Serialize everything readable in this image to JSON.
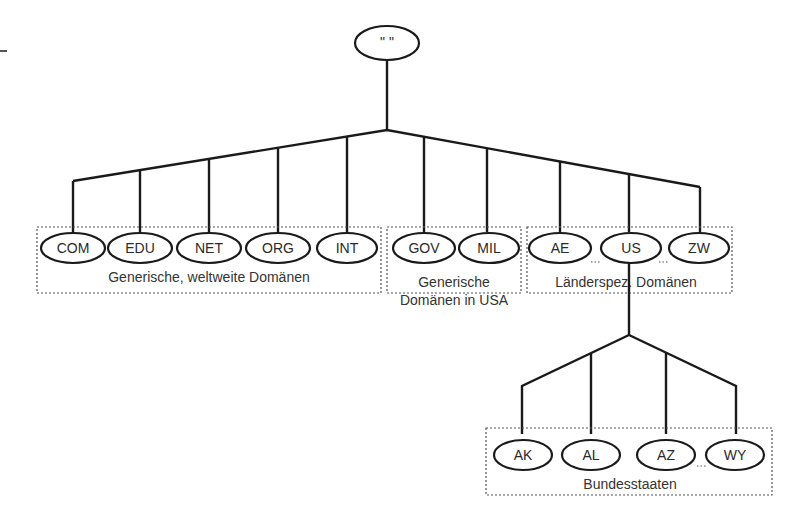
{
  "diagram": {
    "root": {
      "label": "\" \""
    },
    "groups": [
      {
        "label": "Generische, weltweite Domänen",
        "nodes": [
          "COM",
          "EDU",
          "NET",
          "ORG",
          "INT"
        ]
      },
      {
        "label_line1": "Generische",
        "label_line2": "Domänen in USA",
        "nodes": [
          "GOV",
          "MIL"
        ]
      },
      {
        "label": "Länderspez. Domänen",
        "nodes": [
          "AE",
          "US",
          "ZW"
        ],
        "ellipsis_between": [
          [
            "AE",
            "US"
          ],
          [
            "US",
            "ZW"
          ]
        ]
      },
      {
        "label": "Bundesstaaten",
        "parent": "US",
        "nodes": [
          "AK",
          "AL",
          "AZ",
          "WY"
        ],
        "ellipsis_between": [
          [
            "AZ",
            "WY"
          ]
        ]
      }
    ],
    "nodes": {
      "com": "COM",
      "edu": "EDU",
      "net": "NET",
      "org": "ORG",
      "int": "INT",
      "gov": "GOV",
      "mil": "MIL",
      "ae": "AE",
      "us": "US",
      "zw": "ZW",
      "ak": "AK",
      "al": "AL",
      "az": "AZ",
      "wy": "WY"
    },
    "colors": {
      "line": "#1a1a1a",
      "text": "#333333",
      "dotted_box": "#555555",
      "background": "#ffffff"
    }
  }
}
